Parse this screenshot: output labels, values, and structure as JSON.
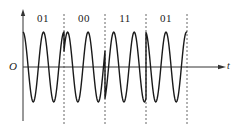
{
  "figure": {
    "type": "QPSK waveform",
    "origin_label": "O",
    "x_axis_label": "t",
    "symbols": [
      {
        "label": "01",
        "phase_pi": 0.0
      },
      {
        "label": "00",
        "phase_pi": -0.35
      },
      {
        "label": "11",
        "phase_pi": -0.85
      },
      {
        "label": "01",
        "phase_pi": 0.05
      }
    ],
    "periods_per_symbol": 2,
    "colors": {
      "wave": "#1a1a1a",
      "axis": "#333333",
      "divider": "#555555"
    }
  },
  "layout": {
    "y_axis_x": 23,
    "y_axis_top": 9,
    "y_axis_bottom": 121,
    "x_axis_y": 67,
    "x_axis_end": 226,
    "symbol_start_x": 23,
    "symbol_width": 41,
    "amplitude": 35,
    "divider_top": 14,
    "divider_bottom": 126
  }
}
